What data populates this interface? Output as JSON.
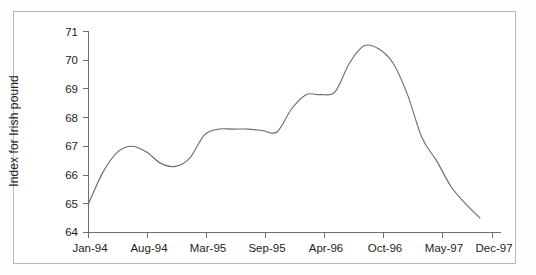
{
  "chart_data": {
    "type": "line",
    "title": "",
    "subtitle": "",
    "xlabel": "",
    "ylabel": "Index for Irish pound",
    "ylim": [
      64,
      71
    ],
    "yticks": [
      64,
      65,
      66,
      67,
      68,
      69,
      70,
      71
    ],
    "ytick_labels": [
      "64",
      "65",
      "66",
      "67",
      "68",
      "69",
      "70",
      "71"
    ],
    "xticks": [
      "Jan-94",
      "Aug-94",
      "Mar-95",
      "Sep-95",
      "Apr-96",
      "Oct-96",
      "May-97",
      "Dec-97"
    ],
    "xtick_labels": [
      "Jan-94",
      "Aug-94",
      "Mar-95",
      "Sep-95",
      "Apr-96",
      "Oct-96",
      "May-97",
      "Dec-97"
    ],
    "grid": false,
    "legend": false,
    "legend_position": "none",
    "line_color": "#6a6a6a",
    "series": [
      {
        "name": "Index for Irish pound",
        "x": [
          "Jan-94",
          "Mar-94",
          "May-94",
          "Aug-94",
          "Oct-94",
          "Dec-94",
          "Jan-95",
          "Mar-95",
          "May-95",
          "Jun-95",
          "Sep-95",
          "Nov-95",
          "Dec-95",
          "Feb-96",
          "Apr-96",
          "Jun-96",
          "Jul-96",
          "Aug-96",
          "Sep-96",
          "Oct-96",
          "Nov-96",
          "Dec-96",
          "Feb-97",
          "Apr-97",
          "May-97",
          "Aug-97",
          "Oct-97",
          "Dec-97"
        ],
        "values": [
          65.0,
          66.1,
          66.8,
          67.0,
          66.8,
          66.4,
          66.3,
          66.6,
          67.4,
          67.6,
          67.6,
          67.6,
          67.55,
          67.5,
          68.3,
          68.8,
          68.8,
          68.9,
          69.9,
          70.5,
          70.4,
          69.9,
          68.8,
          67.3,
          66.5,
          65.6,
          65.0,
          64.5
        ]
      }
    ],
    "annotations": {
      "start_value": 65.0,
      "local_max_aug94": 67.0,
      "local_min_jan95": 66.3,
      "plateau_1995": 67.6,
      "shoulder_mid96": 68.8,
      "peak_oct96": 70.5,
      "end_value_dec97": 64.5
    }
  }
}
